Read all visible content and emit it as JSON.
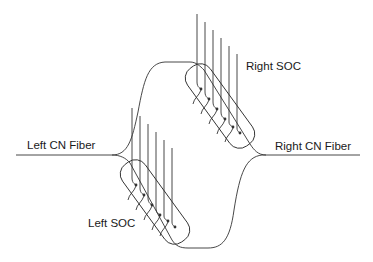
{
  "diagram": {
    "labels": {
      "left_fiber": "Left CN Fiber",
      "right_fiber": "Right CN Fiber",
      "right_soc": "Right SOC",
      "left_soc": "Left SOC"
    },
    "stroke_color": "#333333",
    "soc_channel_count": 6
  }
}
